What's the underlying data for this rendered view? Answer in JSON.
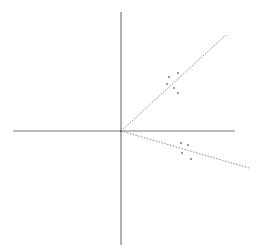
{
  "diagram": {
    "type": "vector-diagram",
    "width": 260,
    "height": 252,
    "colors": {
      "background": "#ffffff",
      "axis": "#7a7a7a",
      "vector": "#8a8a8a",
      "point": "#6e6e6e"
    },
    "origin": {
      "x": 121,
      "y": 131
    },
    "axes": {
      "horizontal": {
        "x1": 13,
        "y1": 131,
        "x2": 235,
        "y2": 131
      },
      "vertical": {
        "x1": 121,
        "y1": 12,
        "x2": 121,
        "y2": 245
      }
    },
    "vectors": [
      {
        "name": "upper-vector",
        "x1": 121,
        "y1": 131,
        "x2": 226,
        "y2": 35
      },
      {
        "name": "lower-vector",
        "x1": 121,
        "y1": 131,
        "x2": 249,
        "y2": 168
      }
    ],
    "point_clusters": [
      {
        "name": "upper-cluster",
        "points": [
          {
            "x": 169,
            "y": 77
          },
          {
            "x": 178,
            "y": 73
          },
          {
            "x": 167,
            "y": 84
          },
          {
            "x": 174,
            "y": 88
          },
          {
            "x": 178,
            "y": 93
          }
        ]
      },
      {
        "name": "lower-cluster",
        "points": [
          {
            "x": 181,
            "y": 143
          },
          {
            "x": 188,
            "y": 145
          },
          {
            "x": 182,
            "y": 153
          },
          {
            "x": 191,
            "y": 159
          }
        ]
      }
    ]
  }
}
